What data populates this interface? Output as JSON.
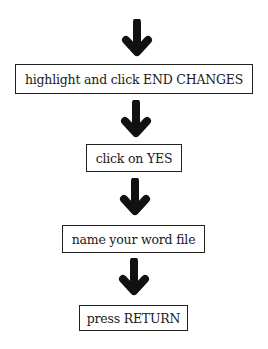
{
  "diagram": {
    "type": "flowchart",
    "direction": "top-to-bottom",
    "arrow_icon": "down-arrow-icon",
    "steps": [
      {
        "label": "highlight and click END CHANGES"
      },
      {
        "label": "click on YES"
      },
      {
        "label": "name your word file"
      },
      {
        "label": "press RETURN"
      }
    ],
    "colors": {
      "arrow": "#111111",
      "border": "#222222",
      "background": "#ffffff",
      "text": "#1a1a1a"
    }
  }
}
